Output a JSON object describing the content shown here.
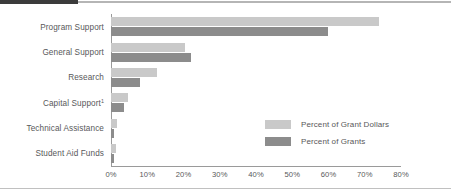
{
  "chart_data": {
    "type": "bar",
    "orientation": "horizontal",
    "title": "",
    "xlabel": "",
    "ylabel": "",
    "xlim": [
      0,
      80
    ],
    "xticks": [
      "0%",
      "10%",
      "20%",
      "30%",
      "40%",
      "50%",
      "60%",
      "70%",
      "80%"
    ],
    "xtick_values": [
      0,
      10,
      20,
      30,
      40,
      50,
      60,
      70,
      80
    ],
    "grid": false,
    "legend_position": "inside-right",
    "categories": [
      "Program Support",
      "General Support",
      "Research",
      "Capital Support",
      "Technical Assistance",
      "Student Aid Funds"
    ],
    "category_footnote_marks": [
      "",
      "",
      "",
      "1",
      "",
      ""
    ],
    "series": [
      {
        "name": "Percent of Grant Dollars",
        "color": "#c9c9c9",
        "values": [
          74,
          20.5,
          12.7,
          4.7,
          1.6,
          1.3
        ]
      },
      {
        "name": "Percent of Grants",
        "color": "#8c8c8c",
        "values": [
          59.8,
          22.0,
          8.0,
          3.5,
          0.9,
          0.9
        ]
      }
    ]
  },
  "legend": {
    "items": [
      {
        "label": "Percent of Grant Dollars",
        "color": "#c9c9c9"
      },
      {
        "label": "Percent of Grants",
        "color": "#8c8c8c"
      }
    ]
  },
  "colors": {
    "grant_dollars": "#c9c9c9",
    "grants": "#8c8c8c",
    "axis": "#9a9a9a",
    "text": "#58585a",
    "top_rule_dark": "#3b3b3b",
    "top_rule_light": "#b5b5b5"
  }
}
